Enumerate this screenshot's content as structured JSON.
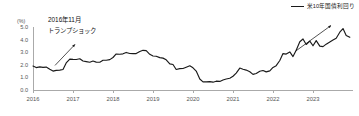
{
  "chart_data": {
    "type": "line",
    "title": "",
    "xlabel": "",
    "ylabel": "(%)",
    "ylim": [
      0.0,
      5.0
    ],
    "yticks": [
      "0.0",
      "1.0",
      "2.0",
      "3.0",
      "4.0",
      "5.0"
    ],
    "xlim": [
      2016.0,
      2024.0
    ],
    "xticks": [
      "2016",
      "2017",
      "2018",
      "2019",
      "2020",
      "2021",
      "2022",
      "2023"
    ],
    "grid": false,
    "legend_position": "top-right",
    "series": [
      {
        "name": "米10年国債利回り",
        "color": "#1a1a1a",
        "x": [
          2016.0,
          2016.08,
          2016.17,
          2016.25,
          2016.33,
          2016.42,
          2016.5,
          2016.58,
          2016.67,
          2016.75,
          2016.83,
          2016.92,
          2017.0,
          2017.08,
          2017.17,
          2017.25,
          2017.33,
          2017.42,
          2017.5,
          2017.58,
          2017.67,
          2017.75,
          2017.83,
          2017.92,
          2018.0,
          2018.08,
          2018.17,
          2018.25,
          2018.33,
          2018.42,
          2018.5,
          2018.58,
          2018.67,
          2018.75,
          2018.83,
          2018.92,
          2019.0,
          2019.08,
          2019.17,
          2019.25,
          2019.33,
          2019.42,
          2019.5,
          2019.58,
          2019.67,
          2019.75,
          2019.83,
          2019.92,
          2020.0,
          2020.08,
          2020.17,
          2020.25,
          2020.33,
          2020.42,
          2020.5,
          2020.58,
          2020.67,
          2020.75,
          2020.83,
          2020.92,
          2021.0,
          2021.08,
          2021.17,
          2021.25,
          2021.33,
          2021.42,
          2021.5,
          2021.58,
          2021.67,
          2021.75,
          2021.83,
          2021.92,
          2022.0,
          2022.08,
          2022.17,
          2022.25,
          2022.33,
          2022.42,
          2022.5,
          2022.58,
          2022.67,
          2022.75,
          2022.83,
          2022.92,
          2023.0,
          2023.08,
          2023.17,
          2023.25,
          2023.33,
          2023.42,
          2023.5,
          2023.58,
          2023.67,
          2023.75,
          2023.83,
          2023.92
        ],
        "values": [
          1.9,
          1.78,
          1.83,
          1.8,
          1.82,
          1.64,
          1.5,
          1.56,
          1.58,
          1.63,
          2.15,
          2.45,
          2.43,
          2.42,
          2.48,
          2.3,
          2.25,
          2.2,
          2.3,
          2.21,
          2.2,
          2.36,
          2.36,
          2.41,
          2.58,
          2.86,
          2.84,
          2.87,
          2.98,
          2.9,
          2.89,
          2.89,
          3.05,
          3.15,
          3.12,
          2.83,
          2.7,
          2.68,
          2.57,
          2.53,
          2.4,
          2.07,
          2.02,
          1.63,
          1.7,
          1.71,
          1.81,
          1.92,
          1.76,
          1.5,
          0.87,
          0.64,
          0.65,
          0.66,
          0.62,
          0.7,
          0.68,
          0.79,
          0.87,
          0.93,
          1.09,
          1.34,
          1.74,
          1.65,
          1.58,
          1.45,
          1.24,
          1.31,
          1.49,
          1.55,
          1.44,
          1.52,
          1.79,
          1.93,
          2.34,
          2.89,
          2.85,
          3.02,
          2.65,
          3.15,
          3.83,
          4.05,
          3.61,
          3.88,
          3.51,
          3.92,
          3.48,
          3.44,
          3.64,
          3.81,
          3.96,
          4.11,
          4.59,
          4.88,
          4.33,
          4.18
        ]
      }
    ],
    "annotations": [
      {
        "id": "trump-shock",
        "line1": "2016年11月",
        "line2": "トランプショック",
        "arrow": {
          "x1": 2016.55,
          "y1": 1.95,
          "x2": 2017.05,
          "y2": 3.62
        }
      },
      {
        "id": "rate-surge",
        "arrow": {
          "x1": 2022.55,
          "y1": 3.05,
          "x2": 2023.45,
          "y2": 5.12
        }
      }
    ]
  },
  "legend": {
    "label": "米10年国債利回り"
  },
  "axis": {
    "y_unit": "(%)"
  }
}
